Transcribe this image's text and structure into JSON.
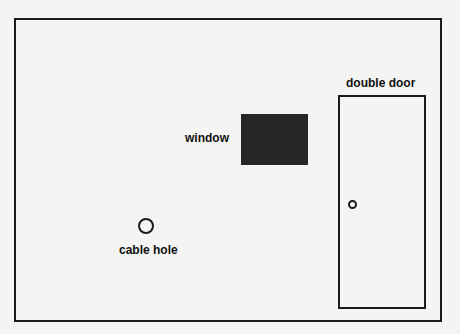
{
  "diagram": {
    "labels": {
      "window": "window",
      "door": "double door",
      "cable_hole": "cable hole"
    },
    "colors": {
      "stroke": "#1a1a1a",
      "window_fill": "#262626",
      "background": "#f4f4f2"
    }
  }
}
